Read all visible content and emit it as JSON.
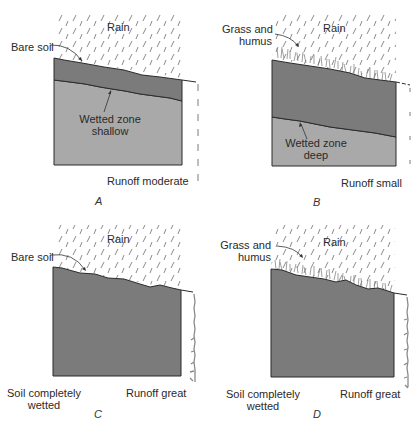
{
  "colors": {
    "wetted_soil": "#7b7b7b",
    "dry_soil": "#a9a9a9",
    "rain": "#8a8a8a",
    "outline": "#2b2b2b",
    "background": "#ffffff"
  },
  "panels": [
    {
      "id": "A",
      "caption": "A",
      "rain_label": "Rain",
      "surface_label": "Bare soil",
      "wetted_label_line1": "Wetted zone",
      "wetted_label_line2": "shallow",
      "runoff_label": "Runoff moderate",
      "wetted_depth": "shallow",
      "runoff": "moderate",
      "cover": "bare soil"
    },
    {
      "id": "B",
      "caption": "B",
      "rain_label": "Rain",
      "surface_label_line1": "Grass and",
      "surface_label_line2": "humus",
      "wetted_label_line1": "Wetted zone",
      "wetted_label_line2": "deep",
      "runoff_label": "Runoff small",
      "wetted_depth": "deep",
      "runoff": "small",
      "cover": "grass and humus"
    },
    {
      "id": "C",
      "caption": "C",
      "rain_label": "Rain",
      "surface_label": "Bare soil",
      "soil_state_line1": "Soil completely",
      "soil_state_line2": "wetted",
      "runoff_label": "Runoff great",
      "wetted_depth": "complete",
      "runoff": "great",
      "cover": "bare soil"
    },
    {
      "id": "D",
      "caption": "D",
      "rain_label": "Rain",
      "surface_label_line1": "Grass and",
      "surface_label_line2": "humus",
      "soil_state_line1": "Soil completely",
      "soil_state_line2": "wetted",
      "runoff_label": "Runoff great",
      "wetted_depth": "complete",
      "runoff": "great",
      "cover": "grass and humus"
    }
  ]
}
